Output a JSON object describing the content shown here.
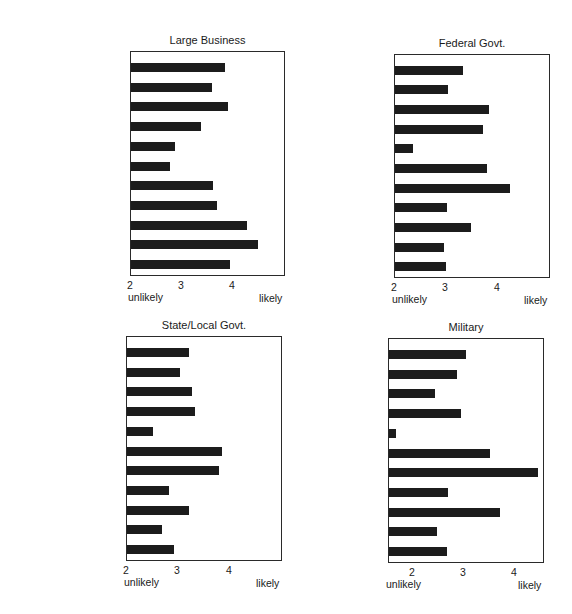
{
  "chart_data": [
    {
      "type": "bar",
      "orientation": "horizontal",
      "title": "Large Business",
      "categories": [
        "Challenging Work",
        "Personal Growth",
        "Pleasant Conditions",
        "Social Relations",
        "Job Autonomy",
        "Service to Society",
        "Job Security",
        "Recognition",
        "Advancement",
        "Financial Reward",
        "Prestige"
      ],
      "values": [
        3.84,
        3.59,
        3.9,
        3.37,
        2.86,
        2.76,
        3.61,
        3.69,
        4.27,
        4.49,
        3.94
      ],
      "xlim": [
        2,
        5.05
      ],
      "xticks": [
        2,
        3,
        4
      ],
      "xlabel_left": "unlikely",
      "xlabel_right": "likely",
      "grid": false,
      "layout": {
        "frame_left": 130,
        "frame_top": 51,
        "frame_right": 285,
        "frame_bottom": 276,
        "tick_x": [
          130,
          181,
          232
        ]
      }
    },
    {
      "type": "bar",
      "orientation": "horizontal",
      "title": "Federal Govt.",
      "categories": [
        "Challenging Work",
        "Personal Growth",
        "Pleasant Conditions",
        "Social Relations",
        "Job Autonomy",
        "Service to Society",
        "Job Security",
        "Recognition",
        "Advancement",
        "Financial Reward",
        "Prestige"
      ],
      "values": [
        3.32,
        3.03,
        3.83,
        3.71,
        2.35,
        3.79,
        4.23,
        3.01,
        3.48,
        2.95,
        2.99
      ],
      "xlim": [
        2,
        5.03
      ],
      "xticks": [
        2,
        3,
        4
      ],
      "xlabel_left": "unlikely",
      "xlabel_right": "likely",
      "grid": false,
      "layout": {
        "frame_left": 394,
        "frame_top": 54,
        "frame_right": 550,
        "frame_bottom": 278,
        "tick_x": [
          394,
          445,
          497
        ]
      }
    },
    {
      "type": "bar",
      "orientation": "horizontal",
      "title": "State/Local Govt.",
      "categories": [
        "Challenging Work",
        "Personal Growth",
        "Pleasant Conditions",
        "Social Relations",
        "Job Autonomy",
        "Service to Society",
        "Job Security",
        "Recognition",
        "Advancement",
        "Financial Reward",
        "Prestige"
      ],
      "values": [
        3.2,
        3.03,
        3.27,
        3.33,
        2.5,
        3.84,
        3.78,
        2.82,
        3.2,
        2.67,
        2.92
      ],
      "xlim": [
        2,
        5.04
      ],
      "xticks": [
        2,
        3,
        4
      ],
      "xlabel_left": "unlikely",
      "xlabel_right": "likely",
      "grid": false,
      "layout": {
        "frame_left": 126,
        "frame_top": 336,
        "frame_right": 282,
        "frame_bottom": 561,
        "tick_x": [
          126,
          177,
          229
        ]
      }
    },
    {
      "type": "bar",
      "orientation": "horizontal",
      "title": "Military",
      "categories": [
        "Challenging Work",
        "Personal Growth",
        "Pleasant Conditions",
        "Social Relations",
        "Job Autonomy",
        "Service to Society",
        "Job Security",
        "Recognition",
        "Advancement",
        "Financial Reward",
        "Prestige"
      ],
      "values": [
        3.04,
        2.86,
        2.43,
        2.94,
        1.67,
        3.51,
        4.45,
        2.69,
        3.7,
        2.47,
        2.67
      ],
      "xlim": [
        1.53,
        4.58
      ],
      "xticks": [
        2,
        3,
        4
      ],
      "xlabel_left": "unlikely",
      "xlabel_right": "likely",
      "grid": false,
      "layout": {
        "frame_left": 388,
        "frame_top": 338,
        "frame_right": 544,
        "frame_bottom": 563,
        "tick_x": [
          412,
          463,
          514
        ]
      }
    }
  ]
}
